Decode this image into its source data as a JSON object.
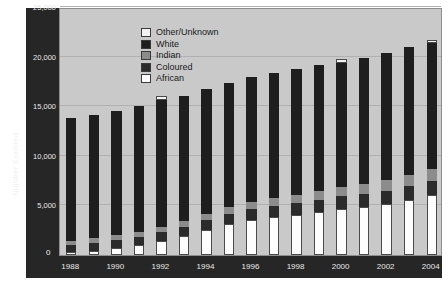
{
  "chart_data": {
    "type": "bar",
    "stacked": true,
    "title": "",
    "xlabel": "",
    "ylabel": "Number Enrolled",
    "ylim": [
      0,
      25000
    ],
    "yticks": [
      "0",
      "5,000",
      "10,000",
      "15,000",
      "20,000",
      "25,000"
    ],
    "ytick_values": [
      0,
      5000,
      10000,
      15000,
      20000,
      25000
    ],
    "grid": true,
    "legend_position": "top-left-inside",
    "categories": [
      "1988",
      "1989",
      "1990",
      "1991",
      "1992",
      "1993",
      "1994",
      "1995",
      "1996",
      "1997",
      "1998",
      "1999",
      "2000",
      "2001",
      "2002",
      "2003",
      "2004"
    ],
    "xtick_labels": [
      "1988",
      "1990",
      "1992",
      "1994",
      "1996",
      "1998",
      "2000",
      "2002",
      "2004"
    ],
    "series": [
      {
        "name": "African",
        "color": "#fdfdfd",
        "values": [
          300,
          450,
          700,
          1000,
          1400,
          1900,
          2500,
          3100,
          3500,
          3800,
          4000,
          4300,
          4600,
          4800,
          5100,
          5500,
          6000
        ]
      },
      {
        "name": "Coloured",
        "color": "#2b2b2b",
        "values": [
          700,
          750,
          800,
          850,
          900,
          950,
          1000,
          1050,
          1100,
          1150,
          1200,
          1250,
          1300,
          1350,
          1400,
          1450,
          1500
        ]
      },
      {
        "name": "Indian",
        "color": "#8c8c8c",
        "values": [
          450,
          480,
          500,
          520,
          560,
          600,
          650,
          700,
          750,
          800,
          850,
          900,
          950,
          1000,
          1050,
          1100,
          1150
        ]
      },
      {
        "name": "White",
        "color": "#1e1e1e",
        "values": [
          12350,
          12420,
          12500,
          12630,
          12740,
          12550,
          12550,
          12450,
          12550,
          12650,
          12700,
          12750,
          12550,
          12750,
          12850,
          12950,
          12750
        ]
      },
      {
        "name": "Other/Unknown",
        "color": "#f2f2f2",
        "values": [
          0,
          0,
          0,
          0,
          400,
          0,
          0,
          0,
          0,
          0,
          0,
          0,
          400,
          0,
          0,
          0,
          300
        ]
      }
    ],
    "totals": [
      13800,
      14100,
      14500,
      15000,
      16000,
      16000,
      16700,
      17300,
      17900,
      18400,
      18750,
      19200,
      19800,
      19900,
      20400,
      21000,
      21700
    ],
    "legend": [
      {
        "label": "Other/Unknown",
        "color": "#f2f2f2"
      },
      {
        "label": "White",
        "color": "#1e1e1e"
      },
      {
        "label": "Indian",
        "color": "#8c8c8c"
      },
      {
        "label": "Coloured",
        "color": "#2b2b2b"
      },
      {
        "label": "African",
        "color": "#fdfdfd"
      }
    ],
    "colors": {
      "plot_background": "#c9c9c9",
      "axis_panel": "#262626",
      "axis_text": "#e8e8e8",
      "gridline": "#b0b0b0",
      "page_background": "#ffffff"
    }
  }
}
